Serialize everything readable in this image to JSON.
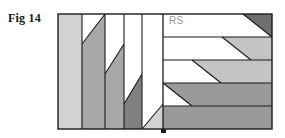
{
  "figure": {
    "label": "Fig 14",
    "inner_label": "RS",
    "caption_color": "#1a1a1a",
    "inner_label_color": "#9a9a9a"
  },
  "canvas": {
    "width": 285,
    "height": 138,
    "background": "#ffffff"
  },
  "frame": {
    "x": 58,
    "y": 14,
    "width": 214,
    "height": 115,
    "stroke": "#1a1a1a",
    "stroke_width": 1.2,
    "divider_x": 163
  },
  "palette": {
    "white": "#ffffff",
    "light_gray": "#d2d2d2",
    "mid_light_gray": "#c4c4c4",
    "mid_gray": "#a8a8a8",
    "gray": "#9a9a9a",
    "dark_gray": "#808080",
    "darkest_gray": "#6f6f6f",
    "outline": "#1a1a1a"
  },
  "left_panel": {
    "description": "Five vertical bands, each split by a rising diagonal separating a white upper-left region from a gray lower-right region",
    "band_edges": [
      58,
      82,
      105,
      124,
      142,
      163
    ],
    "bands": [
      {
        "index": 0,
        "x0": 58,
        "x1": 82,
        "fill": "#d2d2d2",
        "diagonal": false
      },
      {
        "index": 1,
        "x0": 82,
        "x1": 105,
        "fill": "#a8a8a8",
        "diagonal": true,
        "top_y": 14,
        "bottom_y": 44
      },
      {
        "index": 2,
        "x0": 105,
        "x1": 124,
        "fill": "#a8a8a8",
        "diagonal": true,
        "top_y": 44,
        "bottom_y": 74
      },
      {
        "index": 3,
        "x0": 124,
        "x1": 142,
        "fill": "#808080",
        "diagonal": true,
        "top_y": 74,
        "bottom_y": 104
      },
      {
        "index": 4,
        "x0": 142,
        "x1": 163,
        "fill": "#d2d2d2",
        "diagonal": true,
        "top_y": 104,
        "bottom_y": 129
      }
    ]
  },
  "right_panel": {
    "description": "Five horizontal bands, each split by a diagonal separating a white left region from a gray right region; the diagonal shifts left going down",
    "band_edges": [
      14,
      37,
      60,
      83,
      106,
      129
    ],
    "bands": [
      {
        "index": 0,
        "y0": 14,
        "y1": 37,
        "fill": "#6f6f6f",
        "left_x": 243,
        "right_x": 272
      },
      {
        "index": 1,
        "y0": 37,
        "y1": 60,
        "fill": "#c4c4c4",
        "left_x": 222,
        "right_x": 251
      },
      {
        "index": 2,
        "y0": 60,
        "y1": 83,
        "fill": "#c4c4c4",
        "left_x": 192,
        "right_x": 221
      },
      {
        "index": 3,
        "y0": 83,
        "y1": 106,
        "fill": "#9a9a9a",
        "left_x": 163,
        "right_x": 192
      },
      {
        "index": 4,
        "y0": 106,
        "y1": 129,
        "fill": "#9a9a9a",
        "left_x": 163,
        "right_x": 163
      }
    ]
  },
  "marker": {
    "name": "bottom-tick",
    "x": 161,
    "y": 129,
    "width": 5,
    "height": 4,
    "fill": "#1a1a1a"
  }
}
